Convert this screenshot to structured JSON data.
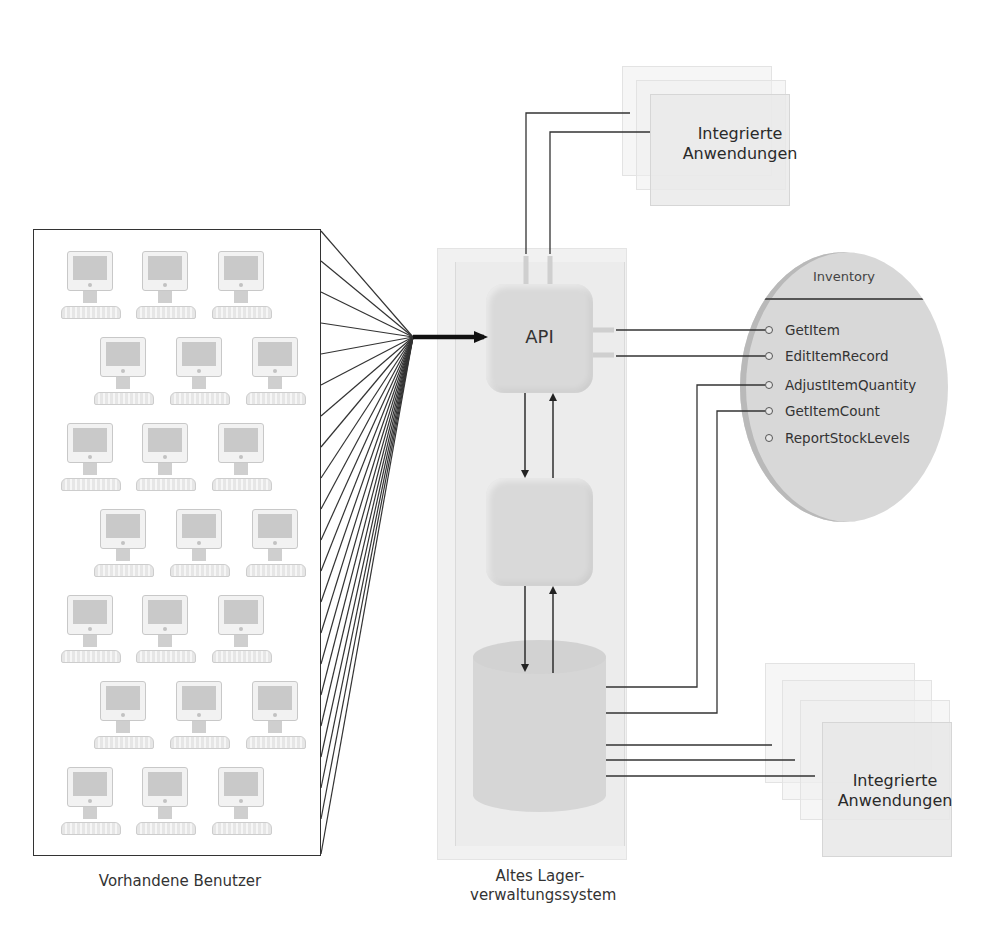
{
  "diagram": {
    "users": {
      "label": "Vorhandene Benutzer",
      "computer_count": 21,
      "rows": [
        3,
        3,
        3,
        3,
        3,
        3,
        3
      ]
    },
    "legacy_system": {
      "label_line1": "Altes Lager-",
      "label_line2": "verwaltungssystem",
      "api_label": "API",
      "components": [
        "api-block",
        "logic-block",
        "database-cylinder"
      ]
    },
    "integrated_apps_top": {
      "label_line1": "Integrierte",
      "label_line2": "Anwendungen"
    },
    "integrated_apps_bottom": {
      "label_line1": "Integrierte",
      "label_line2": "Anwendungen"
    },
    "inventory": {
      "title": "Inventory",
      "methods": [
        {
          "name": "GetItem",
          "connected_to": "API"
        },
        {
          "name": "EditItemRecord",
          "connected_to": "API"
        },
        {
          "name": "AdjustItemQuantity",
          "connected_to": "database"
        },
        {
          "name": "GetItemCount",
          "connected_to": "database"
        },
        {
          "name": "ReportStockLevels",
          "connected_to": null
        }
      ]
    },
    "colors": {
      "line": "#333333",
      "block_fill": "#d9d9d9",
      "container_fill": "#f1f1f1",
      "inventory_fill": "#d8d8d8"
    }
  }
}
